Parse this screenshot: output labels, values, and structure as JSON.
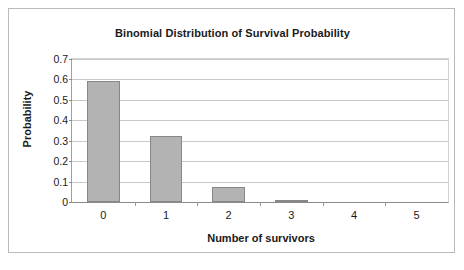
{
  "chart_data": {
    "type": "bar",
    "title": "Binomial Distribution of Survival Probability",
    "xlabel": "Number of survivors",
    "ylabel": "Probability",
    "categories": [
      "0",
      "1",
      "2",
      "3",
      "4",
      "5"
    ],
    "values": [
      0.59,
      0.325,
      0.075,
      0.008,
      0,
      0
    ],
    "ylim": [
      0,
      0.7
    ],
    "ytick_labels": [
      "0.7",
      "0.6",
      "0.5",
      "0.4",
      "0.3",
      "0.2",
      "0.1",
      "0"
    ],
    "ytick_values": [
      0.7,
      0.6,
      0.5,
      0.4,
      0.3,
      0.2,
      0.1,
      0
    ],
    "grid": "horizontal",
    "legend": "none",
    "bar_color": "#b3b3b3",
    "bar_border_color": "#878787",
    "plot_background": "#ffffff"
  }
}
